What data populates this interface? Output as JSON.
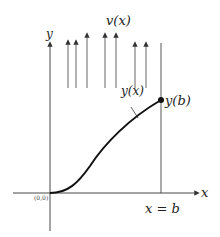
{
  "diagram": {
    "labels": {
      "flow": "v(x)",
      "y_axis": "y",
      "x_axis": "x",
      "curve": "y(x)",
      "endpoint": "y(b)",
      "boundary": "x = b",
      "origin": "(0,0)"
    },
    "colors": {
      "axis": "#333333",
      "curve": "#111111",
      "arrows": "#555555"
    },
    "arrows_x": [
      68,
      76,
      87,
      105,
      116,
      135,
      146
    ]
  }
}
